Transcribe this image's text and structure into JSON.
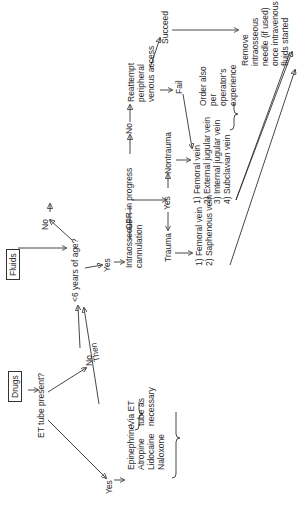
{
  "diagram": {
    "type": "flowchart",
    "orientation": "rotated-90-ccw",
    "colors": {
      "line": "#333333",
      "text": "#2a2a2a",
      "background": "#ffffff"
    },
    "nodes": {
      "drugs": "Drugs",
      "fluids": "Fluids",
      "et_tube_question": "ET tube present?",
      "et_yes": "Yes",
      "et_no": "No",
      "drug_list": "Epinephrine\nAtropine\nLidocaine\nNaloxone",
      "via_et": "Via ET\ntube as\nnecessary",
      "then": "Then",
      "age_question": "<6 years of age?",
      "age_yes": "Yes",
      "age_no": "No",
      "intraosseous": "Intraosseous\ncannulation",
      "cpr": "CPR in progress",
      "cpr_no": "No",
      "cpr_yes": "Yes",
      "reattempt": "Reattempt\nperipheral\nvenous access",
      "trauma": "Trauma",
      "nontrauma": "Nontrauma",
      "trauma_list": "1) Femoral vein\n2) Saphenous vein",
      "nontrauma_list": "1) Femoral vein\n2) External jugular vein\n3) Internal jugular vein\n4) Subclavian vein",
      "order_note": "Order also\nper\noperator's\nexperience",
      "fail": "Fail",
      "succeed": "Succeed",
      "remove": "Remove\nintraosseous\nneedle (if used)\nonce intravenous\nfluids started"
    }
  }
}
